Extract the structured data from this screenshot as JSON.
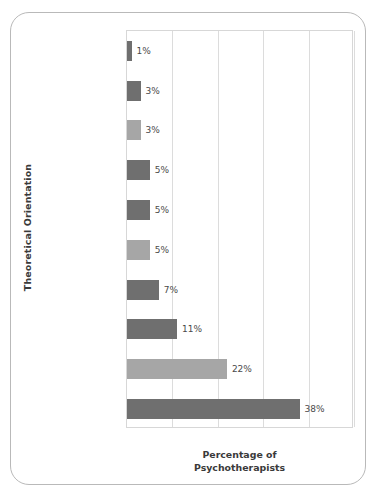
{
  "chart_data": {
    "type": "bar",
    "orientation": "horizontal",
    "title": "",
    "xlabel": "Percentage of Psychotherapists",
    "xlabel_lines": [
      "Percentage of",
      "Psychotherapists"
    ],
    "ylabel": "Theoretical Orientation",
    "xlim": [
      0,
      50
    ],
    "grid": "vertical",
    "gridline_values": [
      0,
      10,
      20,
      30,
      40,
      50
    ],
    "legend": "none",
    "categories": [
      "Gestalt",
      "Client-centered",
      "Other",
      "Cognitive",
      "Existential",
      "Behavioral",
      "Family systems",
      "Freudian psychodynamic",
      "Contemporary psychodynamic",
      "Eclectic"
    ],
    "category_lines": [
      [
        "Gestalt"
      ],
      [
        "Client-centered"
      ],
      [
        "Other"
      ],
      [
        "Cognitive"
      ],
      [
        "Existential"
      ],
      [
        "Behavioral"
      ],
      [
        "Family",
        "systems"
      ],
      [
        "Freudian",
        "psychodynamic"
      ],
      [
        "Contemporary",
        "psychodynamic"
      ],
      [
        "Eclectic"
      ]
    ],
    "values": [
      1,
      3,
      3,
      5,
      5,
      5,
      7,
      11,
      22,
      38
    ],
    "data_labels": [
      "1%",
      "3%",
      "3%",
      "5%",
      "5%",
      "5%",
      "7%",
      "11%",
      "22%",
      "38%"
    ],
    "bar_colors": [
      "#6f6f6f",
      "#6f6f6f",
      "#a6a6a6",
      "#6f6f6f",
      "#6f6f6f",
      "#a6a6a6",
      "#6f6f6f",
      "#6f6f6f",
      "#a6a6a6",
      "#6f6f6f"
    ],
    "colors": {
      "dark_bar": "#6f6f6f",
      "light_bar": "#a6a6a6",
      "gridline": "#dcdcdc",
      "plot_border": "#d7d7d7",
      "frame_border": "#b9b9b9",
      "text": "#3d3d3d",
      "background": "#ffffff"
    }
  }
}
